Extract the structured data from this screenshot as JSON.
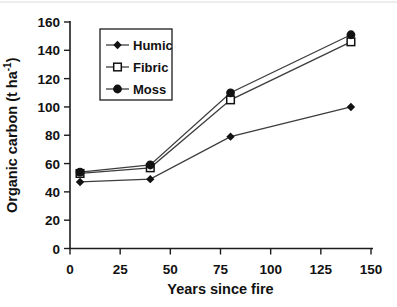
{
  "chart_data": {
    "type": "line",
    "title": "",
    "xlabel": "Years since fire",
    "ylabel": "Organic carbon (t ha-1)",
    "ylabel_parts": {
      "pre": "Organic carbon (t ha",
      "sup": "-1",
      "post": ")"
    },
    "xlim": [
      0,
      150
    ],
    "ylim": [
      0,
      160
    ],
    "xticks": [
      0,
      25,
      50,
      75,
      100,
      125,
      150
    ],
    "yticks": [
      0,
      20,
      40,
      60,
      80,
      100,
      120,
      140,
      160
    ],
    "grid": false,
    "legend": {
      "position": "top-left-inside",
      "border": true,
      "order": [
        "Humic",
        "Fibric",
        "Moss"
      ]
    },
    "x": [
      5,
      40,
      80,
      140
    ],
    "series": [
      {
        "name": "Humic",
        "marker": "filled-diamond",
        "values": [
          47,
          49,
          79,
          100
        ]
      },
      {
        "name": "Fibric",
        "marker": "open-square",
        "values": [
          53,
          57,
          105,
          146
        ]
      },
      {
        "name": "Moss",
        "marker": "filled-circle",
        "values": [
          54,
          59,
          110,
          151
        ]
      }
    ],
    "colors": {
      "line": "#3d3d3d",
      "marker": "#121212",
      "text": "#111111",
      "axis": "#1c1c1c",
      "background": "#ffffff",
      "scan_artifact": "#dcdcdc"
    }
  }
}
